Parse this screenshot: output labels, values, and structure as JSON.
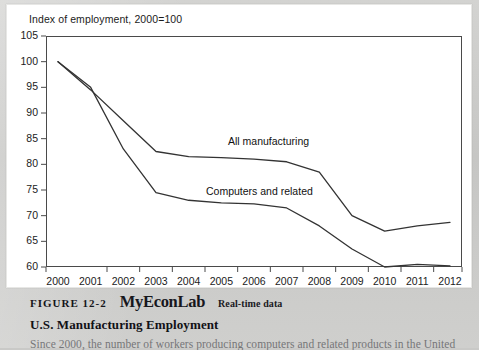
{
  "figure": {
    "axis_title": "Index of employment, 2000=100",
    "number_label": "FIGURE 12-2",
    "brand_label": "MyEconLab",
    "brand_tag": "Real-time data",
    "title": "U.S. Manufacturing Employment",
    "body_text": "Since 2000, the number of workers producing computers and related products in the United"
  },
  "chart_data": {
    "type": "line",
    "title": "Index of employment, 2000=100",
    "xlabel": "",
    "ylabel": "Index of employment, 2000=100",
    "x": [
      2000,
      2001,
      2002,
      2003,
      2004,
      2005,
      2006,
      2007,
      2008,
      2009,
      2010,
      2011,
      2012
    ],
    "xtick_labels": [
      "2000",
      "2001",
      "2002",
      "2003",
      "2004",
      "2005",
      "2006",
      "2007",
      "2008",
      "2009",
      "2010",
      "2011",
      "2012"
    ],
    "ytick_labels": [
      "105",
      "100",
      "95",
      "90",
      "85",
      "80",
      "75",
      "70",
      "65",
      "60"
    ],
    "yticks": [
      105,
      100,
      95,
      90,
      85,
      80,
      75,
      70,
      65,
      60
    ],
    "ylim": [
      60,
      105
    ],
    "xlim": [
      2000,
      2012
    ],
    "grid": false,
    "legend_position": "inline-annotation",
    "series": [
      {
        "name": "All manufacturing",
        "color": "#333333",
        "values": [
          100,
          94.5,
          88.5,
          82.5,
          81.5,
          81.3,
          81.0,
          80.5,
          78.5,
          70.0,
          67.0,
          68.0,
          68.7
        ]
      },
      {
        "name": "Computers and related",
        "color": "#333333",
        "values": [
          100,
          95.0,
          83.0,
          74.5,
          73.0,
          72.5,
          72.3,
          71.5,
          68.0,
          63.5,
          60.0,
          60.5,
          60.2
        ]
      }
    ],
    "annotations": [
      {
        "text": "All manufacturing",
        "x": 2006.0,
        "y": 85.5
      },
      {
        "text": "Computers and related",
        "x": 2005.2,
        "y": 75.5
      }
    ]
  }
}
